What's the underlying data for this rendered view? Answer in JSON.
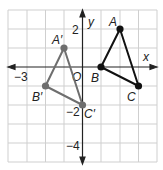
{
  "diagram": {
    "type": "coordinate-plane-translation",
    "axes": {
      "x_label": "x",
      "y_label": "y",
      "origin_label": "O",
      "x_range": [
        -4,
        4
      ],
      "y_range": [
        -5,
        3
      ],
      "tick_labels": {
        "x_neg3": "−3",
        "y_2": "2",
        "y_neg2": "−2",
        "y_neg4": "−4"
      }
    },
    "original_triangle": {
      "color": "#111111",
      "points": [
        {
          "label": "A",
          "x": 2,
          "y": 2
        },
        {
          "label": "B",
          "x": 1,
          "y": 0
        },
        {
          "label": "C",
          "x": 3,
          "y": -1
        }
      ]
    },
    "image_triangle": {
      "color": "#6e6e6e",
      "points": [
        {
          "label": "A′",
          "x": -1,
          "y": 1
        },
        {
          "label": "B′",
          "x": -2,
          "y": -1
        },
        {
          "label": "C′",
          "x": 0,
          "y": -2
        }
      ]
    },
    "grid_color": "#c8c8c8"
  }
}
